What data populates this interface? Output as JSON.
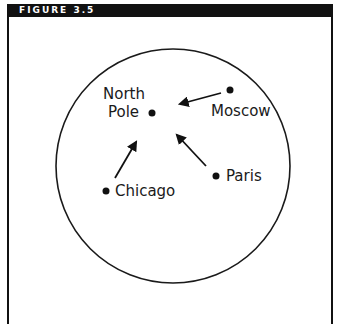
{
  "figure": {
    "label": "FIGURE 3.5"
  },
  "diagram": {
    "circle": {
      "cx": 173,
      "cy": 166,
      "r": 117
    },
    "points": [
      {
        "name": "north_pole",
        "label_lines": [
          "North",
          "Pole"
        ],
        "x": 152,
        "y": 113
      },
      {
        "name": "moscow",
        "label": "Moscow",
        "x": 230,
        "y": 90
      },
      {
        "name": "paris",
        "label": "Paris",
        "x": 216,
        "y": 176
      },
      {
        "name": "chicago",
        "label": "Chicago",
        "x": 106,
        "y": 191
      }
    ],
    "arrows": [
      {
        "from": "Moscow",
        "to": "North Pole"
      },
      {
        "from": "Paris",
        "to": "North Pole"
      },
      {
        "from": "Chicago",
        "to": "North Pole"
      }
    ],
    "colors": {
      "ink": "#111111",
      "background": "#ffffff"
    }
  }
}
